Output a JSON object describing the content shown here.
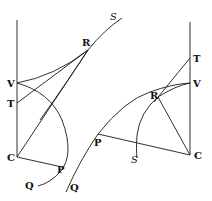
{
  "diagram": {
    "left_figure": {
      "labels": {
        "V": "V",
        "T": "T",
        "C": "C",
        "P": "P",
        "Q": "Q",
        "R": "R",
        "S": "S"
      }
    },
    "right_figure": {
      "labels": {
        "T": "T",
        "V": "V",
        "R": "R",
        "P": "P",
        "S": "S",
        "C": "C",
        "Q": "Q"
      }
    },
    "colors": {
      "ink": "#1a1a1a",
      "background": "#ffffff"
    }
  }
}
